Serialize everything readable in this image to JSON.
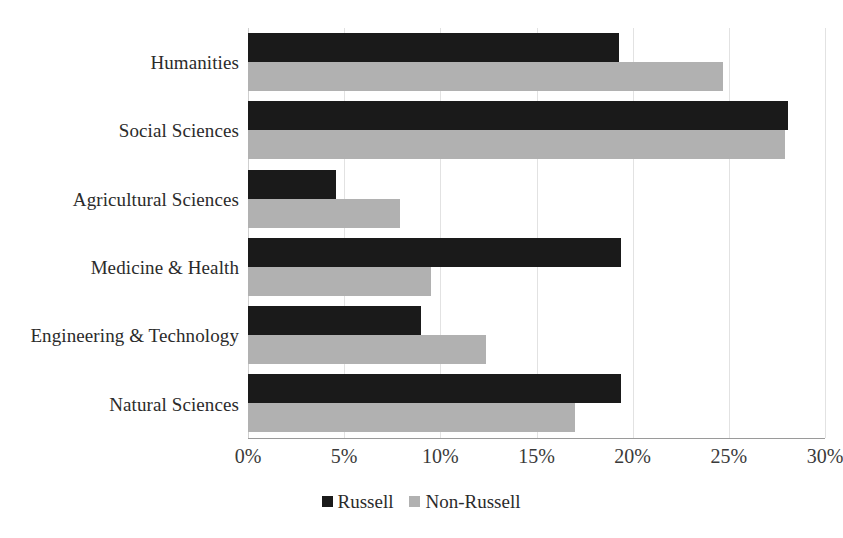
{
  "chart_data": {
    "type": "bar",
    "orientation": "horizontal",
    "title": "",
    "subtitle": "",
    "xlabel": "",
    "ylabel": "",
    "xlim": [
      0,
      30
    ],
    "x_tick_labels": [
      "0%",
      "5%",
      "10%",
      "15%",
      "20%",
      "25%",
      "30%"
    ],
    "x_tick_values": [
      0,
      5,
      10,
      15,
      20,
      25,
      30
    ],
    "grid": true,
    "legend_position": "bottom",
    "categories": [
      "Humanities",
      "Social Sciences",
      "Agricultural Sciences",
      "Medicine & Health",
      "Engineering & Technology",
      "Natural Sciences"
    ],
    "series": [
      {
        "name": "Russell",
        "color": "#1a1a1a",
        "values": [
          19.3,
          28.1,
          4.6,
          19.4,
          9.0,
          19.4
        ]
      },
      {
        "name": "Non-Russell",
        "color": "#b1b1b1",
        "values": [
          24.7,
          27.9,
          7.9,
          9.5,
          12.4,
          17.0
        ]
      }
    ]
  },
  "legend": {
    "items": [
      {
        "label": "Russell",
        "color": "#1a1a1a"
      },
      {
        "label": "Non-Russell",
        "color": "#b1b1b1"
      }
    ]
  }
}
